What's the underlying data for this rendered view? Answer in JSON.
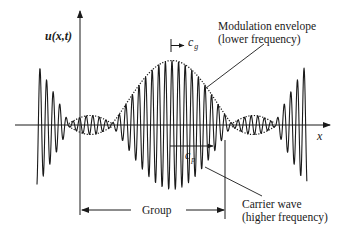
{
  "diagram": {
    "axes": {
      "y_label": "u(x,t)",
      "x_label": "x"
    },
    "labels": {
      "group_velocity": {
        "symbol": "c",
        "subscript": "g"
      },
      "phase_velocity": {
        "symbol": "c",
        "subscript": "p"
      },
      "envelope_line1": "Modulation envelope",
      "envelope_line2": "(lower frequency)",
      "carrier_line1": "Carrier wave",
      "carrier_line2": "(higher frequency)",
      "group": "Group"
    },
    "colors": {
      "ink": "#1a1a1a",
      "background": "#ffffff"
    },
    "wave": {
      "x_start": 37,
      "x_end": 307,
      "baseline_y": 125,
      "center_x": 172,
      "carrier_period_px": 6.6,
      "main_lobe_halfwidth_px": 60,
      "main_amplitude_px": 63,
      "side_amplitude_px": 8,
      "edge_amplitude_px": 62
    }
  }
}
